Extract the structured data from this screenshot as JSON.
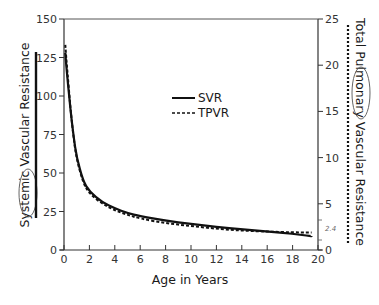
{
  "chart_data": {
    "type": "line",
    "title": "",
    "xlabel": "Age in Years",
    "ylabel": "Systemic Vascular Resistance",
    "ylabel_right": "Total Pulmonary Vascular Resistance",
    "xlim": [
      0,
      20
    ],
    "ylim": [
      0,
      150
    ],
    "ylim_right": [
      0,
      25
    ],
    "x_ticks": [
      0,
      2,
      4,
      6,
      8,
      10,
      12,
      14,
      16,
      18,
      20
    ],
    "y_ticks": [
      0,
      25,
      50,
      75,
      100,
      125,
      150
    ],
    "y_ticks_right": [
      0,
      5,
      10,
      15,
      20,
      25
    ],
    "grid": false,
    "legend_position": "upper-center",
    "annotations": [
      "2.4"
    ],
    "series": [
      {
        "name": "SVR",
        "axis": "left",
        "style": "solid",
        "x": [
          0.1,
          0.25,
          0.5,
          0.75,
          1,
          1.5,
          2,
          3,
          4,
          5,
          6,
          8,
          10,
          12,
          14,
          16,
          18,
          19.5
        ],
        "values": [
          128,
          113,
          92,
          74,
          60,
          45,
          38,
          31,
          27,
          24,
          22,
          19,
          17,
          15,
          13.5,
          12,
          10.5,
          9
        ]
      },
      {
        "name": "TPVR",
        "axis": "right",
        "style": "dashed",
        "x": [
          0.1,
          0.25,
          0.5,
          0.75,
          1,
          1.5,
          2,
          3,
          4,
          5,
          6,
          8,
          10,
          12,
          14,
          16,
          18,
          19.5
        ],
        "values": [
          22.2,
          19.5,
          15.5,
          12.2,
          9.8,
          7.3,
          6.1,
          5.0,
          4.3,
          3.8,
          3.4,
          2.9,
          2.6,
          2.3,
          2.1,
          2.0,
          1.9,
          1.9
        ]
      }
    ]
  },
  "legend": {
    "svr_label": "SVR",
    "tpvr_label": "TPVR"
  },
  "axes": {
    "x_title": "Age in Years",
    "left_title": "Systemic Vascular Resistance",
    "right_title": "Total Pulmonary Vascular Resistance",
    "annotation_note": "2.4"
  }
}
